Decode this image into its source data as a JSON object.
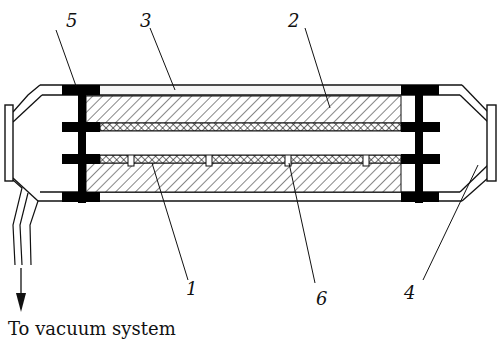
{
  "diagram": {
    "type": "cross-section schematic",
    "colors": {
      "line": "#111111",
      "flange": "#000000",
      "background": "#ffffff"
    },
    "labels": [
      {
        "id": "5",
        "text": "5",
        "x": 66,
        "y": 12
      },
      {
        "id": "3",
        "text": "3",
        "x": 140,
        "y": 12
      },
      {
        "id": "2",
        "text": "2",
        "x": 288,
        "y": 12
      },
      {
        "id": "1",
        "text": "1",
        "x": 186,
        "y": 280
      },
      {
        "id": "6",
        "text": "6",
        "x": 316,
        "y": 290
      },
      {
        "id": "4",
        "text": "4",
        "x": 404,
        "y": 284
      }
    ],
    "caption": "To vacuum system",
    "components": [
      {
        "number": "1",
        "points_to": "lower cross-hatched layer"
      },
      {
        "number": "2",
        "points_to": "upper diagonal-hatched body"
      },
      {
        "number": "3",
        "points_to": "outer tube wall"
      },
      {
        "number": "4",
        "points_to": "right end window"
      },
      {
        "number": "5",
        "points_to": "left black flange"
      },
      {
        "number": "6",
        "points_to": "slot in lower cross-hatched layer"
      }
    ]
  }
}
